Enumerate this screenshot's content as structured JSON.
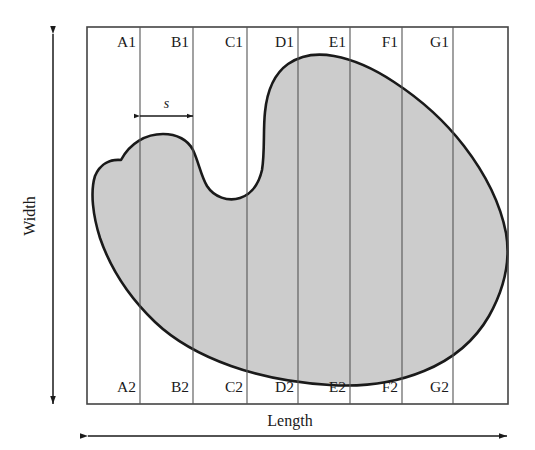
{
  "figure": {
    "type": "technical-diagram",
    "fill_color": "#cccccc",
    "outline_color": "#1a1a1a",
    "grid_line_color": "#555555",
    "background_color": "#ffffff",
    "box": {
      "left": 87,
      "top": 27,
      "right": 508,
      "bottom": 404
    }
  },
  "axes": {
    "x_label": "Length",
    "y_label": "Width"
  },
  "dimension": {
    "label": "s",
    "from_x": 140,
    "to_x": 193,
    "y": 116
  },
  "columns": [
    {
      "top_label": "A1",
      "bottom_label": "A2",
      "x_start": 87,
      "x_end": 140
    },
    {
      "top_label": "B1",
      "bottom_label": "B2",
      "x_start": 140,
      "x_end": 193
    },
    {
      "top_label": "C1",
      "bottom_label": "C2",
      "x_start": 193,
      "x_end": 247
    },
    {
      "top_label": "D1",
      "bottom_label": "D2",
      "x_start": 247,
      "x_end": 298
    },
    {
      "top_label": "E1",
      "bottom_label": "E2",
      "x_start": 298,
      "x_end": 350
    },
    {
      "top_label": "F1",
      "bottom_label": "F2",
      "x_start": 350,
      "x_end": 402
    },
    {
      "top_label": "G1",
      "bottom_label": "G2",
      "x_start": 402,
      "x_end": 453
    }
  ],
  "grid_lines_x": [
    140,
    193,
    247,
    298,
    350,
    402,
    453
  ],
  "label_rows": {
    "top_y": 47,
    "bottom_y": 392
  },
  "shape_path": "M 121,160 C 130,143 146,134 163,134 C 177,134 188,140 193,150 C 199,163 201,176 207,186 C 214,197 228,202 240,198 C 252,194 259,183 262,170 C 265,152 263,130 265,112 C 267,92 274,74 288,64 C 301,55 318,53 334,56 C 356,60 376,70 394,82 C 420,99 444,120 464,146 C 484,172 500,202 506,233 C 511,262 503,291 489,316 C 474,342 451,360 424,371 C 395,383 362,387 330,385 C 296,383 262,377 231,366 C 203,356 176,342 155,322 C 131,299 111,270 100,238 C 93,216 90,192 95,176 C 100,164 110,159 121,160 Z"
}
